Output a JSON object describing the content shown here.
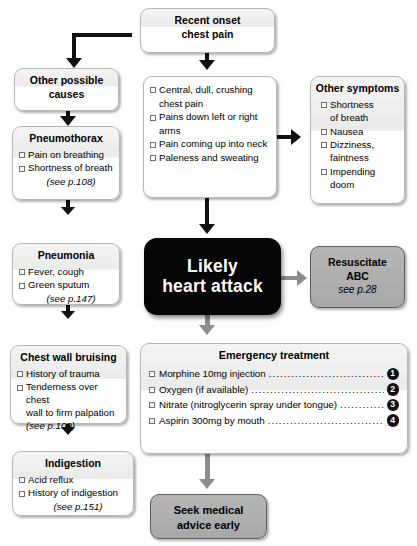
{
  "diagram": {
    "colors": {
      "accent_black": "#050505",
      "gray_box": "#b0b0b0",
      "connector_black": "#111111",
      "connector_gray": "#8d8d8d"
    }
  },
  "nodes": {
    "start": {
      "title_line1": "Recent onset",
      "title_line2": "chest pain"
    },
    "other_causes": {
      "title_line1": "Other possible",
      "title_line2": "causes"
    },
    "pneumothorax": {
      "title": "Pneumothorax",
      "items": [
        "Pain on breathing",
        "Shortness of breath"
      ],
      "ref": "(see p.108)"
    },
    "pneumonia": {
      "title": "Pneumonia",
      "items": [
        "Fever, cough",
        "Green sputum"
      ],
      "ref": "(see p.147)"
    },
    "chest_wall_bruising": {
      "title": "Chest wall bruising",
      "items": [
        "History of trauma",
        "Tenderness over chest"
      ],
      "continuation": "wall to firm palpation",
      "ref": "(see p.109)"
    },
    "indigestion": {
      "title": "Indigestion",
      "items": [
        "Acid reflux",
        "History of indigestion"
      ],
      "ref": "(see p.151)"
    },
    "cardinal_symptoms": {
      "items": [
        "Central, dull, crushing",
        "Pains down left or right",
        "Pain coming up into neck",
        "Paleness and sweating"
      ],
      "wrap1": "chest pain",
      "wrap2": "arms"
    },
    "other_symptoms": {
      "title": "Other symptoms",
      "items": [
        "Shortness",
        "Nausea",
        "Dizziness,",
        "Impending"
      ],
      "wrap1": "of breath",
      "wrap2": "faintness",
      "wrap3": "doom"
    },
    "likely_heart_attack": {
      "line1": "Likely",
      "line2": "heart attack"
    },
    "resuscitate": {
      "line1": "Resuscitate",
      "line2": "ABC",
      "ref": "see p.28"
    },
    "emergency_treatment": {
      "title": "Emergency treatment",
      "rows": [
        {
          "text": "Morphine 10mg injection",
          "num": "1"
        },
        {
          "text": "Oxygen (if available)",
          "num": "2"
        },
        {
          "text": "Nitrate (nitroglycerin spray under tongue)",
          "num": "3"
        },
        {
          "text": "Aspirin 300mg by mouth",
          "num": "4"
        }
      ],
      "dots": "................................................................"
    },
    "seek_advice": {
      "line1": "Seek medical",
      "line2": "advice early"
    }
  }
}
